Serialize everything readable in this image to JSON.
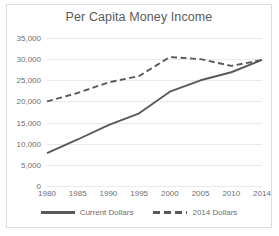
{
  "chart_data": {
    "type": "line",
    "title": "Per Capita Money Income",
    "xlabel": "",
    "ylabel": "",
    "x": [
      "1980",
      "1985",
      "1990",
      "1995",
      "2000",
      "2005",
      "2010",
      "2014"
    ],
    "categories": [
      "1980",
      "1985",
      "1990",
      "1995",
      "2000",
      "2005",
      "2010",
      "2014"
    ],
    "series": [
      {
        "name": "Current Dollars",
        "style": "solid",
        "color": "#595959",
        "values": [
          7800,
          11000,
          14400,
          17200,
          22300,
          25000,
          26900,
          29800
        ]
      },
      {
        "name": "2014 Dollars",
        "style": "dashed",
        "color": "#595959",
        "values": [
          20000,
          22000,
          24500,
          26000,
          30500,
          30000,
          28400,
          29800
        ]
      }
    ],
    "ylim": [
      0,
      35000
    ],
    "ytick_values": [
      35000,
      30000,
      25000,
      20000,
      15000,
      10000,
      5000,
      0
    ],
    "ytick_labels": [
      "35,000",
      "30,000",
      "25,000",
      "20,000",
      "15,000",
      "10,000",
      "5,000",
      "0"
    ],
    "grid": true,
    "grid_axis": "y",
    "legend_position": "bottom"
  },
  "style": {
    "line_color": "#595959",
    "grid_color": "#e9e9e9",
    "frame_color": "#dedede",
    "text_color": "#6e6e6e",
    "title_color": "#5a5a5a",
    "background": "#ffffff"
  },
  "legend": [
    {
      "label": "Current Dollars"
    },
    {
      "label": "2014 Dollars"
    }
  ]
}
